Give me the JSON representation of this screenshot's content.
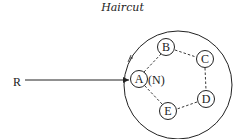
{
  "title": "Haircut",
  "external_node": "R",
  "nodes": [
    {
      "id": "A",
      "label": "A",
      "x": 139,
      "y": 79
    },
    {
      "id": "B",
      "label": "B",
      "x": 166,
      "y": 48
    },
    {
      "id": "C",
      "label": "C",
      "x": 205,
      "y": 59
    },
    {
      "id": "D",
      "label": "D",
      "x": 206,
      "y": 99
    },
    {
      "id": "E",
      "label": "E",
      "x": 168,
      "y": 111
    }
  ],
  "node_annotation": "(N)",
  "edges": [
    [
      "A",
      "B"
    ],
    [
      "B",
      "C"
    ],
    [
      "C",
      "D"
    ],
    [
      "D",
      "E"
    ],
    [
      "E",
      "A"
    ]
  ],
  "colors": {
    "ink": "#222222",
    "background": "#ffffff"
  }
}
